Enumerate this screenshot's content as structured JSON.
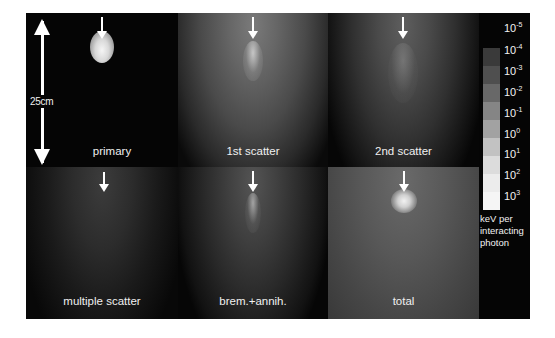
{
  "figure": {
    "scale_bar": {
      "label": "25cm"
    },
    "panels": [
      {
        "id": "primary",
        "label": "primary"
      },
      {
        "id": "first",
        "label": "1st scatter"
      },
      {
        "id": "second",
        "label": "2nd scatter"
      },
      {
        "id": "multiple",
        "label": "multiple scatter"
      },
      {
        "id": "brem",
        "label": "brem.+annih."
      },
      {
        "id": "total",
        "label": "total"
      }
    ],
    "legend": {
      "ticks": [
        {
          "base": "10",
          "exp": "-5"
        },
        {
          "base": "10",
          "exp": "-4"
        },
        {
          "base": "10",
          "exp": "-3"
        },
        {
          "base": "10",
          "exp": "-2"
        },
        {
          "base": "10",
          "exp": "-1"
        },
        {
          "base": "10",
          "exp": "0"
        },
        {
          "base": "10",
          "exp": "1"
        },
        {
          "base": "10",
          "exp": "2"
        },
        {
          "base": "10",
          "exp": "3"
        }
      ],
      "caption": "keV per interacting photon",
      "colors": [
        "#3a3a3a",
        "#4f4f4f",
        "#686868",
        "#858585",
        "#a2a2a2",
        "#c2c2c2",
        "#dcdcdc",
        "#ececec",
        "#f5f5f5"
      ]
    }
  }
}
